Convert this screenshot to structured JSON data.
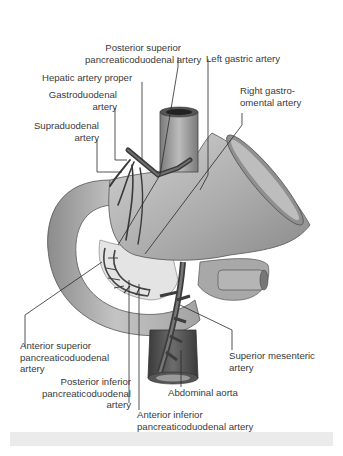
{
  "figure": {
    "labels": {
      "posterior_superior_pd": [
        "Posterior superior",
        "pancreaticoduodenal artery"
      ],
      "left_gastric": [
        "Left gastric artery"
      ],
      "hepatic_proper": [
        "Hepatic artery proper"
      ],
      "gastroduodenal": [
        "Gastroduodenal",
        "artery"
      ],
      "right_gastroomental": [
        "Right gastro-",
        "omental artery"
      ],
      "supraduodenal": [
        "Supraduodenal",
        "artery"
      ],
      "anterior_superior_pd": [
        "Anterior superior",
        "pancreaticoduodenal",
        "artery"
      ],
      "posterior_inferior_pd": [
        "Posterior inferior",
        "pancreaticoduodenal",
        "artery"
      ],
      "superior_mesenteric": [
        "Superior mesenteric",
        "artery"
      ],
      "abdominal_aorta": [
        "Abdominal aorta"
      ],
      "anterior_inferior_pd": [
        "Anterior inferior",
        "pancreaticoduodenal artery"
      ]
    },
    "colors": {
      "text": "#3a3a3a",
      "leader": "#2a2a2a",
      "organ_light": "#c9c9c9",
      "organ_mid": "#a6a6a6",
      "organ_dark": "#6a6a6a",
      "vessel": "#4a4a4a",
      "footer_bar": "#ebebeb"
    }
  }
}
